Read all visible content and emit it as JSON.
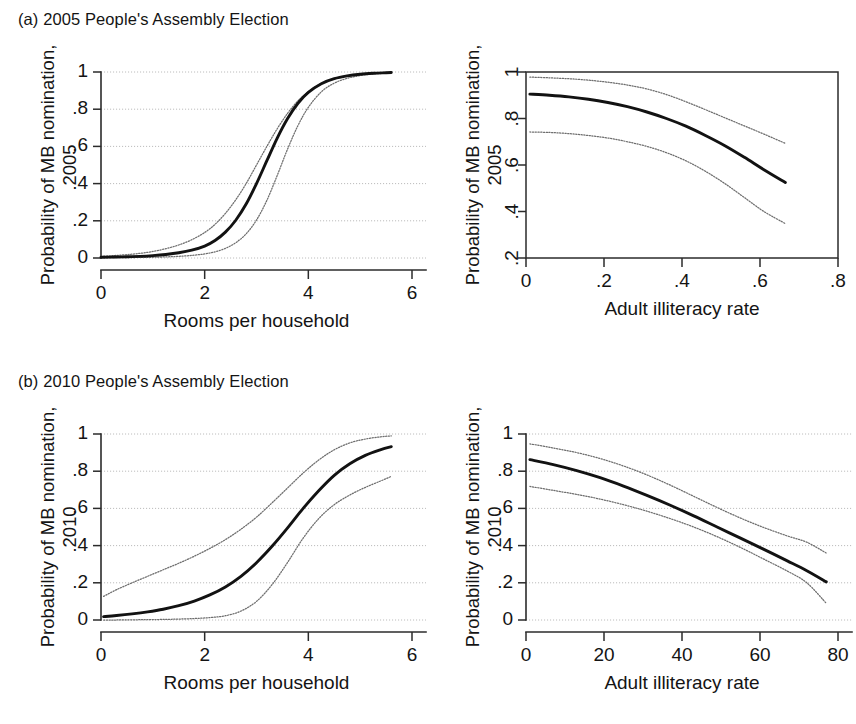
{
  "figure": {
    "width": 856,
    "height": 724,
    "background": "#ffffff",
    "fit_line_color": "#121212",
    "ci_line_color": "#6e6e6e",
    "grid_color": "#b4b4b4",
    "axis_color": "#2b2b2b"
  },
  "groups": [
    {
      "id": "a",
      "title": "(a) 2005 People's Assembly Election"
    },
    {
      "id": "b",
      "title": "(b) 2010 People's Assembly Election"
    }
  ],
  "chart_data": [
    {
      "id": "a-left",
      "type": "line",
      "title": "(a) 2005 People's Assembly Election",
      "xlabel": "Rooms per household",
      "ylabel_line1": "Probability of MB nomination,",
      "ylabel_line2": "2005",
      "xlim": [
        0,
        6
      ],
      "ylim": [
        0,
        1
      ],
      "xticks": [
        0,
        2,
        4,
        6
      ],
      "xticklabels": [
        "0",
        "2",
        "4",
        "6"
      ],
      "yticks": [
        0,
        0.2,
        0.4,
        0.6,
        0.8,
        1
      ],
      "yticklabels": [
        "0",
        ".2",
        ".4",
        ".6",
        ".8",
        "1"
      ],
      "ytick_rotated": false,
      "grid": "horizontal",
      "frame": "left-bottom",
      "x": [
        0,
        0.25,
        0.5,
        0.75,
        1,
        1.25,
        1.5,
        1.75,
        2,
        2.2,
        2.4,
        2.6,
        2.8,
        3,
        3.2,
        3.4,
        3.6,
        3.8,
        4,
        4.25,
        4.5,
        4.75,
        5,
        5.25,
        5.5,
        5.6
      ],
      "series": [
        {
          "name": "fitted probability",
          "style": "solid",
          "values": [
            0.004,
            0.005,
            0.007,
            0.009,
            0.013,
            0.019,
            0.028,
            0.042,
            0.064,
            0.094,
            0.139,
            0.203,
            0.29,
            0.4,
            0.523,
            0.645,
            0.75,
            0.832,
            0.89,
            0.937,
            0.964,
            0.979,
            0.988,
            0.993,
            0.996,
            0.997
          ]
        },
        {
          "name": "upper 95% confidence bound",
          "style": "dotted",
          "values": [
            0.009,
            0.013,
            0.018,
            0.025,
            0.035,
            0.05,
            0.07,
            0.098,
            0.137,
            0.181,
            0.24,
            0.313,
            0.4,
            0.5,
            0.6,
            0.695,
            0.778,
            0.845,
            0.894,
            0.938,
            0.963,
            0.978,
            0.987,
            0.992,
            0.996,
            0.997
          ]
        },
        {
          "name": "lower 95% confidence bound",
          "style": "dotted",
          "values": [
            0.001,
            0.0015,
            0.002,
            0.003,
            0.004,
            0.006,
            0.009,
            0.014,
            0.022,
            0.033,
            0.052,
            0.082,
            0.13,
            0.204,
            0.31,
            0.444,
            0.586,
            0.712,
            0.81,
            0.893,
            0.94,
            0.966,
            0.981,
            0.989,
            0.994,
            0.996
          ]
        }
      ]
    },
    {
      "id": "a-right",
      "type": "line",
      "title": "(a) 2005 People's Assembly Election",
      "xlabel": "Adult illiteracy rate",
      "ylabel_line1": "Probability of MB nomination,",
      "ylabel_line2": "2005",
      "xlim": [
        0,
        0.8
      ],
      "ylim": [
        0.2,
        1
      ],
      "xticks": [
        0,
        0.2,
        0.4,
        0.6,
        0.8
      ],
      "xticklabels": [
        "0",
        ".2",
        ".4",
        ".6",
        ".8"
      ],
      "yticks": [
        0.2,
        0.4,
        0.6,
        0.8,
        1
      ],
      "yticklabels": [
        ".2",
        ".4",
        ".6",
        ".8",
        "1"
      ],
      "ytick_rotated": true,
      "grid": "none",
      "frame": "box",
      "x": [
        0.01,
        0.06,
        0.11,
        0.16,
        0.21,
        0.26,
        0.31,
        0.36,
        0.41,
        0.46,
        0.51,
        0.56,
        0.61,
        0.665
      ],
      "series": [
        {
          "name": "fitted probability",
          "style": "solid",
          "values": [
            0.905,
            0.9,
            0.893,
            0.883,
            0.869,
            0.851,
            0.828,
            0.8,
            0.767,
            0.727,
            0.683,
            0.633,
            0.58,
            0.525
          ]
        },
        {
          "name": "upper 95% confidence bound",
          "style": "dotted",
          "values": [
            0.978,
            0.975,
            0.971,
            0.965,
            0.956,
            0.944,
            0.927,
            0.903,
            0.872,
            0.838,
            0.803,
            0.768,
            0.733,
            0.693
          ]
        },
        {
          "name": "lower 95% confidence bound",
          "style": "dotted",
          "values": [
            0.742,
            0.74,
            0.735,
            0.727,
            0.716,
            0.7,
            0.68,
            0.653,
            0.618,
            0.573,
            0.52,
            0.46,
            0.4,
            0.348
          ]
        }
      ]
    },
    {
      "id": "b-left",
      "type": "line",
      "title": "(b) 2010 People's Assembly Election",
      "xlabel": "Rooms per household",
      "ylabel_line1": "Probability of MB nomination,",
      "ylabel_line2": "2010",
      "xlim": [
        0,
        6
      ],
      "ylim": [
        0,
        1
      ],
      "xticks": [
        0,
        2,
        4,
        6
      ],
      "xticklabels": [
        "0",
        "2",
        "4",
        "6"
      ],
      "yticks": [
        0,
        0.2,
        0.4,
        0.6,
        0.8,
        1
      ],
      "yticklabels": [
        "0",
        ".2",
        ".4",
        ".6",
        ".8",
        "1"
      ],
      "ytick_rotated": false,
      "grid": "horizontal",
      "frame": "left-bottom",
      "x": [
        0.05,
        0.3,
        0.6,
        0.9,
        1.2,
        1.5,
        1.8,
        2.1,
        2.4,
        2.7,
        3,
        3.3,
        3.6,
        3.9,
        4.2,
        4.5,
        4.8,
        5.1,
        5.4,
        5.6
      ],
      "series": [
        {
          "name": "fitted probability",
          "style": "solid",
          "values": [
            0.018,
            0.024,
            0.033,
            0.044,
            0.058,
            0.077,
            0.102,
            0.135,
            0.178,
            0.235,
            0.308,
            0.396,
            0.495,
            0.6,
            0.695,
            0.778,
            0.84,
            0.885,
            0.916,
            0.932
          ]
        },
        {
          "name": "upper 95% confidence bound",
          "style": "dotted",
          "values": [
            0.127,
            0.163,
            0.2,
            0.235,
            0.27,
            0.305,
            0.343,
            0.385,
            0.432,
            0.488,
            0.553,
            0.63,
            0.71,
            0.79,
            0.86,
            0.915,
            0.952,
            0.973,
            0.985,
            0.99
          ]
        },
        {
          "name": "lower 95% confidence bound",
          "style": "dotted",
          "values": [
            0.0,
            0.0,
            0.001,
            0.002,
            0.003,
            0.005,
            0.008,
            0.013,
            0.023,
            0.048,
            0.1,
            0.19,
            0.31,
            0.44,
            0.545,
            0.62,
            0.672,
            0.713,
            0.748,
            0.772
          ]
        }
      ]
    },
    {
      "id": "b-right",
      "type": "line",
      "title": "(b) 2010 People's Assembly Election",
      "xlabel": "Adult illiteracy rate",
      "ylabel_line1": "Probability of MB nomination,",
      "ylabel_line2": "2010",
      "xlim": [
        0,
        80
      ],
      "ylim": [
        0,
        1
      ],
      "xticks": [
        0,
        20,
        40,
        60,
        80
      ],
      "xticklabels": [
        "0",
        "20",
        "40",
        "60",
        "80"
      ],
      "yticks": [
        0,
        0.2,
        0.4,
        0.6,
        0.8,
        1
      ],
      "yticklabels": [
        "0",
        ".2",
        ".4",
        ".6",
        ".8",
        "1"
      ],
      "ytick_rotated": false,
      "grid": "horizontal",
      "frame": "left-bottom",
      "x": [
        1,
        7,
        13,
        19,
        25,
        31,
        37,
        43,
        49,
        55,
        61,
        67,
        72,
        77
      ],
      "series": [
        {
          "name": "fitted probability",
          "style": "solid",
          "values": [
            0.862,
            0.835,
            0.803,
            0.765,
            0.72,
            0.67,
            0.617,
            0.56,
            0.5,
            0.44,
            0.38,
            0.318,
            0.265,
            0.205
          ]
        },
        {
          "name": "upper 95% confidence bound",
          "style": "dotted",
          "values": [
            0.947,
            0.925,
            0.9,
            0.868,
            0.828,
            0.78,
            0.725,
            0.665,
            0.605,
            0.548,
            0.497,
            0.452,
            0.418,
            0.36
          ]
        },
        {
          "name": "lower 95% confidence bound",
          "style": "dotted",
          "values": [
            0.718,
            0.697,
            0.675,
            0.65,
            0.62,
            0.585,
            0.545,
            0.5,
            0.448,
            0.39,
            0.327,
            0.263,
            0.2,
            0.09
          ]
        }
      ]
    }
  ]
}
